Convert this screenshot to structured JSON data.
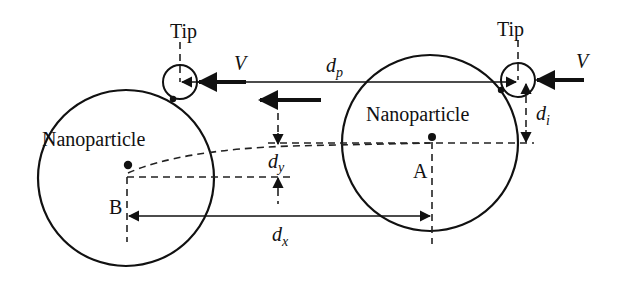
{
  "diagram": {
    "type": "schematic",
    "colors": {
      "stroke": "#111111",
      "background": "#ffffff"
    },
    "labels": {
      "tip_left": "Tip",
      "tip_right": "Tip",
      "velocity_left": "V",
      "velocity_right": "V",
      "nanoparticle_left": "Nanoparticle",
      "nanoparticle_right": "Nanoparticle",
      "point_a": "A",
      "point_b": "B",
      "d_p_main": "d",
      "d_p_sub": "p",
      "d_i_main": "d",
      "d_i_sub": "i",
      "d_y_main": "d",
      "d_y_sub": "y",
      "d_x_main": "d",
      "d_x_sub": "x"
    },
    "nodes": [
      {
        "id": "tip-left",
        "label": "Tip",
        "shape": "circle"
      },
      {
        "id": "tip-right",
        "label": "Tip",
        "shape": "circle"
      },
      {
        "id": "particle-b",
        "label": "Nanoparticle",
        "center_label": "B",
        "shape": "circle"
      },
      {
        "id": "particle-a",
        "label": "Nanoparticle",
        "center_label": "A",
        "shape": "circle"
      }
    ],
    "dimensions": [
      {
        "id": "d_p",
        "description": "tip travel distance between tip positions"
      },
      {
        "id": "d_i",
        "description": "vertical offset between tip and particle A center"
      },
      {
        "id": "d_y",
        "description": "vertical displacement of particle"
      },
      {
        "id": "d_x",
        "description": "horizontal displacement of particle from A to B"
      }
    ],
    "arrows": [
      {
        "id": "velocity-left",
        "label": "V",
        "direction": "left"
      },
      {
        "id": "velocity-right",
        "label": "V",
        "direction": "left"
      },
      {
        "id": "motion-direction",
        "direction": "left"
      }
    ]
  }
}
